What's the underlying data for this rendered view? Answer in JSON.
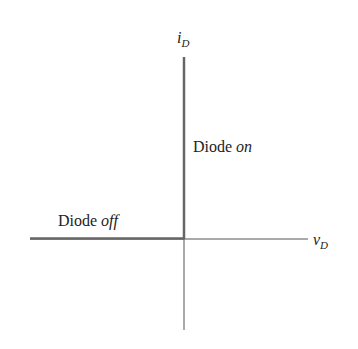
{
  "diagram": {
    "axes": {
      "y_label": {
        "main": "i",
        "sub": "D"
      },
      "x_label": {
        "main": "v",
        "sub": "D"
      }
    },
    "regions": [
      {
        "name": "on",
        "text": "Diode ",
        "italic": "on"
      },
      {
        "name": "off",
        "text": "Diode ",
        "italic": "off"
      }
    ],
    "colors": {
      "axis": "#555555",
      "characteristic": "#666666",
      "text": "#222222"
    }
  }
}
